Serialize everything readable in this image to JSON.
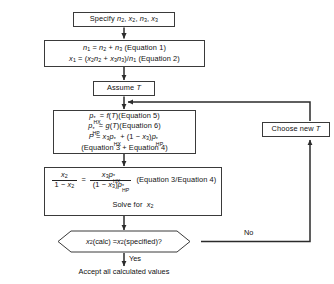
{
  "diagram": {
    "type": "flowchart",
    "line_color": "#3a3a3a",
    "background": "#ffffff",
    "nodes": [
      {
        "id": "specify",
        "shape": "rectangle",
        "text": "Specify n2, x2, n3, x3"
      },
      {
        "id": "equations12",
        "shape": "rectangle",
        "line1": "n1 = n2 + n3 (Equation 1)",
        "line2": "x1 = (x2n2 + x3n3)/n1 (Equation 2)"
      },
      {
        "id": "assume_t",
        "shape": "rectangle",
        "text": "Assume T"
      },
      {
        "id": "equations56",
        "shape": "rectangle",
        "line1": "p*HX = f(T)(Equation 5)",
        "line2": "p*HP = g(T)(Equation 6)",
        "line3": "P = x3p*HX + (1 - x3)p*HP",
        "line4": "(Equation 3 + Equation 4)"
      },
      {
        "id": "ratio",
        "shape": "rectangle",
        "equation": "x2/(1 - x2) = x3p*HX/((1 - x3)p*HP)",
        "reference": "(Equation 3/Equation 4)",
        "solve_for": "Solve for  x2"
      },
      {
        "id": "decision",
        "shape": "diamond",
        "text": "x2(calc) = x2(specified)?"
      },
      {
        "id": "choose_new_t",
        "shape": "rectangle",
        "text": "Choose new T"
      },
      {
        "id": "accept",
        "shape": "text",
        "text": "Accept all calculated values"
      }
    ],
    "edge_labels": {
      "no": "No",
      "yes": "Yes"
    }
  }
}
